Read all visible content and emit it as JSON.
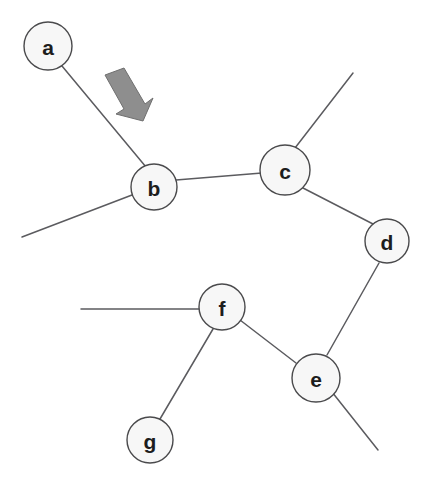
{
  "diagram": {
    "background_color": "#ffffff",
    "width": 436,
    "height": 486,
    "node_fill_color": "#f7f7f7",
    "node_stroke_color": "#4a4a4c",
    "edge_color": "#5b5b5f",
    "arrow_color": "#8e8e8e"
  },
  "nodes": [
    {
      "id": "a",
      "label": "a",
      "cx": 48,
      "cy": 46,
      "r": 24
    },
    {
      "id": "b",
      "label": "b",
      "cx": 154,
      "cy": 187,
      "r": 23
    },
    {
      "id": "c",
      "label": "c",
      "cx": 285,
      "cy": 170,
      "r": 25
    },
    {
      "id": "d",
      "label": "d",
      "cx": 387,
      "cy": 241,
      "r": 22
    },
    {
      "id": "e",
      "label": "e",
      "cx": 316,
      "cy": 378,
      "r": 24
    },
    {
      "id": "f",
      "label": "f",
      "cx": 222,
      "cy": 307,
      "r": 23
    },
    {
      "id": "g",
      "label": "g",
      "cx": 150,
      "cy": 440,
      "r": 23
    }
  ],
  "edges": [
    {
      "id": "edge-a-b",
      "from": "a",
      "to": "b",
      "x1": 62,
      "y1": 66,
      "x2": 146,
      "y2": 167
    },
    {
      "id": "edge-b-c",
      "from": "b",
      "to": "c",
      "x1": 176,
      "y1": 180,
      "x2": 262,
      "y2": 173
    },
    {
      "id": "edge-c-d",
      "from": "c",
      "to": "d",
      "x1": 303,
      "y1": 188,
      "x2": 373,
      "y2": 224
    },
    {
      "id": "edge-d-e",
      "from": "d",
      "to": "e",
      "x1": 379,
      "y1": 263,
      "x2": 327,
      "y2": 355
    },
    {
      "id": "edge-e-f",
      "from": "e",
      "to": "f",
      "x1": 296,
      "y1": 363,
      "x2": 240,
      "y2": 320
    },
    {
      "id": "edge-f-g",
      "from": "f",
      "to": "g",
      "x1": 213,
      "y1": 329,
      "x2": 160,
      "y2": 419
    },
    {
      "id": "edge-b-stub-left",
      "from": "b",
      "to": "stub",
      "x1": 132,
      "y1": 195,
      "x2": 22,
      "y2": 237
    },
    {
      "id": "edge-c-stub-upright",
      "from": "c",
      "to": "stub",
      "x1": 295,
      "y1": 148,
      "x2": 353,
      "y2": 73
    },
    {
      "id": "edge-e-stub-lowright",
      "from": "e",
      "to": "stub",
      "x1": 332,
      "y1": 392,
      "x2": 378,
      "y2": 450
    },
    {
      "id": "edge-f-stub-left",
      "from": "f",
      "to": "stub",
      "x1": 199,
      "y1": 309,
      "x2": 81,
      "y2": 309
    }
  ],
  "annotation": {
    "arrow": {
      "name": "gray-block-arrow",
      "direction": "down-right",
      "points": "105,75 124,68 145,104 153,98 143,121 116,114 124,109"
    }
  }
}
